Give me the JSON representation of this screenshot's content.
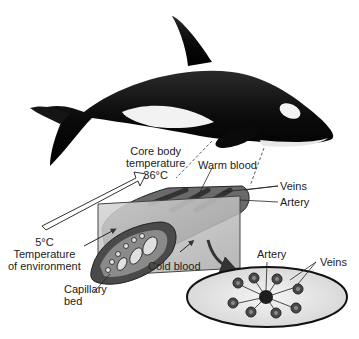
{
  "diagram": {
    "labels": {
      "core_body_line1": "Core body",
      "core_body_line2": "temperature",
      "core_body_temp": "36°C",
      "warm_blood": "Warm blood",
      "veins_top": "Veins",
      "artery_top": "Artery",
      "env_temp": "5°C",
      "env_line1": "Temperature",
      "env_line2": "of environment",
      "cold_blood": "Cold blood",
      "capillary_line1": "Capillary",
      "capillary_line2": "bed",
      "artery_cross": "Artery",
      "veins_cross": "Veins"
    },
    "colors": {
      "whale_body": "#0c0c0c",
      "whale_belly": "#f4f4f4",
      "flipper_section": "#6a6a6a",
      "plane": "#c8c8c8",
      "cross_section_fill": "#ececec",
      "vessel": "#3a3a3a"
    }
  }
}
